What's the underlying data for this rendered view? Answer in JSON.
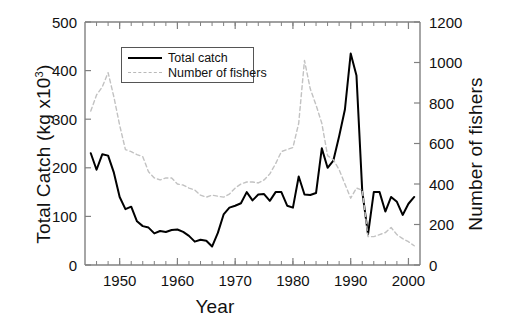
{
  "chart_data": {
    "type": "line",
    "title": "",
    "xlabel": "Year",
    "ylabel": "Total Catch (kg x10",
    "ylabel_sup": "3",
    "ylabel_tail": ")",
    "y2label": "Number of fishers",
    "xlim": [
      1944,
      2002
    ],
    "ylim": [
      0,
      500
    ],
    "y2lim": [
      0,
      1200
    ],
    "xticks": [
      1950,
      1960,
      1970,
      1980,
      1990,
      2000
    ],
    "xtick_labels": [
      "1950",
      "1960",
      "1970",
      "1980",
      "1990",
      "2000"
    ],
    "xminor_step": 2,
    "yticks": [
      0,
      100,
      200,
      300,
      400,
      500
    ],
    "ytick_labels": [
      "0",
      "100",
      "200",
      "300",
      "400",
      "500"
    ],
    "y2ticks": [
      0,
      200,
      400,
      600,
      800,
      1000,
      1200
    ],
    "y2tick_labels": [
      "0",
      "200",
      "400",
      "600",
      "800",
      "1000",
      "1200"
    ],
    "grid": false,
    "legend_position": "upper-left-inside",
    "series": [
      {
        "name": "Total catch",
        "axis": "left",
        "units": "kg x10^3",
        "style": "solid",
        "color": "#000000",
        "x": [
          1945,
          1946,
          1947,
          1948,
          1949,
          1950,
          1951,
          1952,
          1953,
          1954,
          1955,
          1956,
          1957,
          1958,
          1959,
          1960,
          1961,
          1962,
          1963,
          1964,
          1965,
          1966,
          1967,
          1968,
          1969,
          1970,
          1971,
          1972,
          1973,
          1974,
          1975,
          1976,
          1977,
          1978,
          1979,
          1980,
          1981,
          1982,
          1983,
          1984,
          1985,
          1986,
          1987,
          1988,
          1989,
          1990,
          1991,
          1992,
          1993,
          1994,
          1995,
          1996,
          1997,
          1998,
          1999,
          2000,
          2001
        ],
        "values": [
          230,
          196,
          228,
          225,
          190,
          140,
          115,
          120,
          90,
          80,
          77,
          65,
          70,
          68,
          72,
          73,
          68,
          60,
          48,
          52,
          50,
          38,
          66,
          104,
          118,
          122,
          127,
          150,
          133,
          145,
          146,
          132,
          150,
          150,
          122,
          118,
          182,
          145,
          144,
          148,
          240,
          200,
          215,
          265,
          320,
          435,
          390,
          152,
          63,
          150,
          150,
          110,
          140,
          130,
          103,
          126,
          140
        ]
      },
      {
        "name": "Number of fishers",
        "axis": "right",
        "units": "fishers",
        "style": "dashed",
        "color": "#c2c2c2",
        "x": [
          1945,
          1946,
          1947,
          1948,
          1949,
          1950,
          1951,
          1952,
          1953,
          1954,
          1955,
          1956,
          1957,
          1958,
          1959,
          1960,
          1961,
          1962,
          1963,
          1964,
          1965,
          1966,
          1967,
          1968,
          1969,
          1970,
          1971,
          1972,
          1973,
          1974,
          1975,
          1976,
          1977,
          1978,
          1979,
          1980,
          1981,
          1982,
          1983,
          1984,
          1985,
          1986,
          1987,
          1988,
          1989,
          1990,
          1991,
          1992,
          1993,
          1994,
          1995,
          1996,
          1997,
          1998,
          1999,
          2000,
          2001
        ],
        "values": [
          760,
          840,
          880,
          950,
          830,
          690,
          570,
          560,
          545,
          535,
          460,
          430,
          420,
          430,
          430,
          400,
          395,
          380,
          370,
          345,
          335,
          345,
          340,
          335,
          350,
          380,
          400,
          410,
          410,
          405,
          420,
          450,
          500,
          560,
          570,
          580,
          700,
          1010,
          870,
          790,
          700,
          540,
          520,
          470,
          400,
          330,
          380,
          370,
          140,
          140,
          150,
          160,
          185,
          150,
          130,
          115,
          95
        ]
      }
    ]
  },
  "legend": {
    "items": [
      {
        "label": "Total catch",
        "style": "solid",
        "color": "#000000"
      },
      {
        "label": "Number of fishers",
        "style": "dashed",
        "color": "#b9b9b9"
      }
    ]
  },
  "axes": {
    "left_title_main": "Total Catch (kg x10",
    "left_title_sup": "3",
    "left_title_end": ")",
    "right_title": "Number of fishers",
    "bottom_title": "Year"
  },
  "colors": {
    "axis": "#808080",
    "catch_line": "#000000",
    "fishers_line": "#c2c2c2",
    "text": "#111111",
    "background": "#ffffff"
  }
}
